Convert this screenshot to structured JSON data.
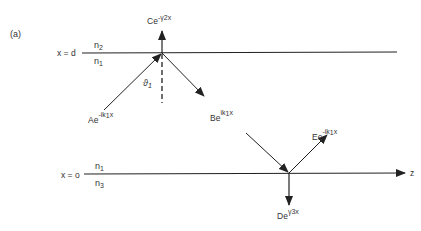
{
  "figure": {
    "panel_label": "(a)",
    "interfaces": [
      {
        "position_label": "x = d",
        "above_medium": "n",
        "above_sub": "2",
        "below_medium": "n",
        "below_sub": "1"
      },
      {
        "position_label": "x = o",
        "above_medium": "n",
        "above_sub": "1",
        "below_medium": "n",
        "below_sub": "3"
      }
    ],
    "axis_label": "z",
    "angle_label": {
      "symbol": "ϑ",
      "sub": "1"
    },
    "waves": {
      "A": {
        "base": "Ae",
        "exp": "-ik",
        "exp_sub": "1",
        "exp_tail": "x"
      },
      "B": {
        "base": "Be",
        "exp": "ik",
        "exp_sub": "1",
        "exp_tail": "x"
      },
      "C": {
        "base": "Ce",
        "exp": "-γ",
        "exp_sub": "2",
        "exp_tail": "x"
      },
      "D": {
        "base": "De",
        "exp": "γ",
        "exp_sub": "3",
        "exp_tail": "x"
      },
      "E": {
        "base": "Ee",
        "exp": "-ik",
        "exp_sub": "1",
        "exp_tail": "x"
      }
    }
  }
}
